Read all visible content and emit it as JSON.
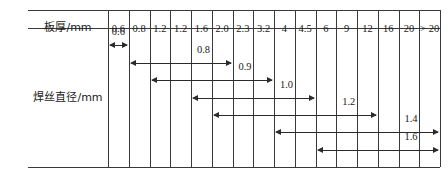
{
  "table": {
    "header_row_label": "板厚/mm",
    "side_row_label": "焊丝直径/mm",
    "columns": [
      "0.6",
      "0.8",
      "1.2",
      "1.2",
      "1.6",
      "2.0",
      "2.3",
      "3.2",
      "4",
      "4.5",
      "6",
      "9",
      "12",
      "16",
      "20",
      "> 20"
    ],
    "arrows": [
      {
        "label": "0.6",
        "start_col": 0,
        "end_col": 0
      },
      {
        "label": "0.8",
        "start_col": 1,
        "end_col": 5
      },
      {
        "label": "0.9",
        "start_col": 2,
        "end_col": 7
      },
      {
        "label": "1.0",
        "start_col": 4,
        "end_col": 9
      },
      {
        "label": "1.2",
        "start_col": 5,
        "end_col": 12
      },
      {
        "label": "1.4",
        "start_col": 8,
        "end_col": 15
      },
      {
        "label": "1.6",
        "start_col": 10,
        "end_col": 15
      }
    ]
  },
  "colors": {
    "line": "#3a3a3a",
    "arrow": "#2b2b2b",
    "text": "#1a1a1a",
    "background": "#ffffff"
  }
}
